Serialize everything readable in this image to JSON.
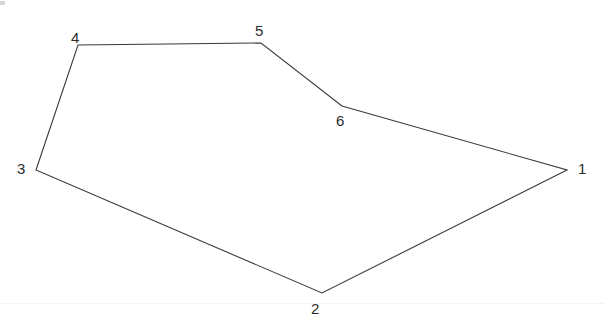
{
  "figure": {
    "background_color": "#ffffff",
    "stroke_color": "#3a3a3a",
    "stroke_width": 1.1,
    "label_color": "#2b2b2b",
    "scan_line_color": "#f4f4f4",
    "scan_line_y": 303,
    "width": 604,
    "height": 336
  },
  "chart_data": {
    "type": "scatter",
    "xlabel": "",
    "ylabel": "",
    "xlim": [
      0,
      604
    ],
    "ylim": [
      0,
      336
    ],
    "grid": false,
    "legend": "none",
    "closed_path": true,
    "categories": [
      "1",
      "2",
      "3",
      "4",
      "5",
      "6"
    ],
    "points": [
      {
        "label": "1",
        "x": 567,
        "y": 170,
        "label_x": 578,
        "label_y": 161
      },
      {
        "label": "2",
        "x": 322,
        "y": 293,
        "label_x": 311,
        "label_y": 301
      },
      {
        "label": "3",
        "x": 36,
        "y": 170,
        "label_x": 17,
        "label_y": 161
      },
      {
        "label": "4",
        "x": 78,
        "y": 45,
        "label_x": 71,
        "label_y": 30
      },
      {
        "label": "5",
        "x": 261,
        "y": 43,
        "label_x": 255,
        "label_y": 23
      },
      {
        "label": "6",
        "x": 342,
        "y": 106,
        "label_x": 336,
        "label_y": 113
      }
    ],
    "edges": [
      {
        "from": "1",
        "to": "2"
      },
      {
        "from": "2",
        "to": "3"
      },
      {
        "from": "3",
        "to": "4"
      },
      {
        "from": "4",
        "to": "5"
      },
      {
        "from": "5",
        "to": "6"
      },
      {
        "from": "6",
        "to": "1"
      }
    ],
    "path_d": "M 567,170 L 322,293 L 36,170 L 78,45 L 261,43 L 342,106 Z"
  }
}
